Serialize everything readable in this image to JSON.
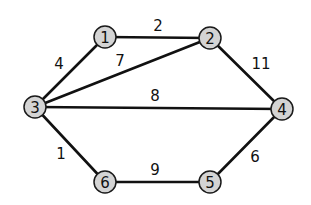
{
  "graph": {
    "nodes": [
      {
        "id": "1",
        "label": "1",
        "x": 105,
        "y": 37
      },
      {
        "id": "2",
        "label": "2",
        "x": 210,
        "y": 38
      },
      {
        "id": "3",
        "label": "3",
        "x": 35,
        "y": 107
      },
      {
        "id": "4",
        "label": "4",
        "x": 282,
        "y": 109
      },
      {
        "id": "5",
        "label": "5",
        "x": 210,
        "y": 182
      },
      {
        "id": "6",
        "label": "6",
        "x": 105,
        "y": 182
      }
    ],
    "edges": [
      {
        "from": "1",
        "to": "2",
        "weight": "2",
        "label_x": 158,
        "label_y": 26
      },
      {
        "from": "1",
        "to": "3",
        "weight": "4",
        "label_x": 59,
        "label_y": 64
      },
      {
        "from": "3",
        "to": "2",
        "weight": "7",
        "label_x": 120,
        "label_y": 61
      },
      {
        "from": "2",
        "to": "4",
        "weight": "11",
        "label_x": 261,
        "label_y": 64
      },
      {
        "from": "3",
        "to": "4",
        "weight": "8",
        "label_x": 155,
        "label_y": 96
      },
      {
        "from": "3",
        "to": "6",
        "weight": "1",
        "label_x": 61,
        "label_y": 154
      },
      {
        "from": "6",
        "to": "5",
        "weight": "9",
        "label_x": 155,
        "label_y": 170
      },
      {
        "from": "4",
        "to": "5",
        "weight": "6",
        "label_x": 255,
        "label_y": 157
      }
    ],
    "colors": {
      "node_fill": "#d4d4d4",
      "node_stroke": "#1a1a1a",
      "edge": "#111111",
      "text": "#111111",
      "background": "#ffffff"
    }
  }
}
